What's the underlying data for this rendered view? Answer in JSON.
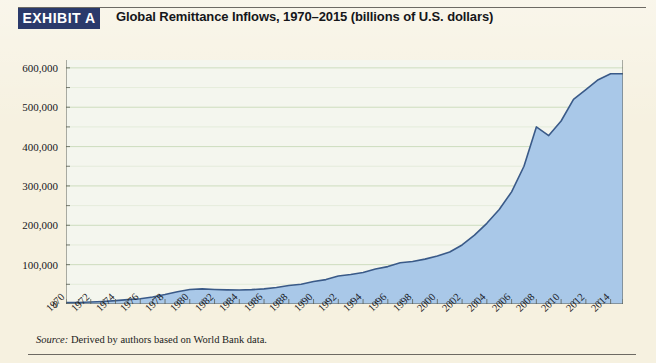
{
  "exhibit": {
    "badge_label": "EXHIBIT A",
    "title": "Global Remittance Inflows, 1970–2015 (billions of U.S. dollars)"
  },
  "source_note": {
    "prefix": "Source:",
    "text": "Derived by authors based on World Bank data."
  },
  "colors": {
    "page_background": "#f6f1e0",
    "badge_background": "#2b3a6b",
    "badge_text": "#ffffff",
    "plot_background": "#f4f6ee",
    "area_fill": "#a9c8e8",
    "area_line": "#3a5a88",
    "gridline": "#cdddbe",
    "axis": "#5c5f55",
    "rule": "#6d6a63"
  },
  "chart_data": {
    "type": "area",
    "title": "Global Remittance Inflows, 1970–2015 (billions of U.S. dollars)",
    "xlabel": "",
    "ylabel": "",
    "ylim": [
      0,
      620000
    ],
    "xlim": [
      1970,
      2015
    ],
    "grid": true,
    "legend": "none",
    "ytick_values": [
      0,
      100000,
      200000,
      300000,
      400000,
      500000,
      600000
    ],
    "ytick_labels": [
      "0",
      "100,000",
      "200,000",
      "300,000",
      "400,000",
      "500,000",
      "600,000"
    ],
    "minor_ytick_values": [
      50000,
      150000,
      250000,
      350000,
      450000,
      550000
    ],
    "xtick_labels": [
      "1970",
      "1972",
      "1974",
      "1976",
      "1978",
      "1980",
      "1982",
      "1984",
      "1986",
      "1988",
      "1990",
      "1992",
      "1994",
      "1996",
      "1998",
      "2000",
      "2002",
      "2004",
      "2006",
      "2008",
      "2010",
      "2012",
      "2014"
    ],
    "x": [
      1970,
      1971,
      1972,
      1973,
      1974,
      1975,
      1976,
      1977,
      1978,
      1979,
      1980,
      1981,
      1982,
      1983,
      1984,
      1985,
      1986,
      1987,
      1988,
      1989,
      1990,
      1991,
      1992,
      1993,
      1994,
      1995,
      1996,
      1997,
      1998,
      1999,
      2000,
      2001,
      2002,
      2003,
      2004,
      2005,
      2006,
      2007,
      2008,
      2009,
      2010,
      2011,
      2012,
      2013,
      2014,
      2015
    ],
    "values": [
      3500,
      4000,
      5000,
      6500,
      8500,
      11000,
      13500,
      18000,
      24000,
      31000,
      37000,
      38500,
      37000,
      36000,
      35500,
      36500,
      38500,
      42000,
      47000,
      50000,
      57000,
      62000,
      71000,
      75000,
      80000,
      89000,
      95000,
      105000,
      108000,
      114000,
      122000,
      132000,
      150000,
      175000,
      205000,
      240000,
      285000,
      350000,
      450000,
      428000,
      465000,
      520000,
      545000,
      570000,
      585000,
      585000
    ],
    "annotations": [
      {
        "label": "2008 pre-crisis peak",
        "x": 2008,
        "y": 450000
      },
      {
        "label": "2009 financial-crisis dip",
        "x": 2009,
        "y": 428000
      }
    ]
  }
}
